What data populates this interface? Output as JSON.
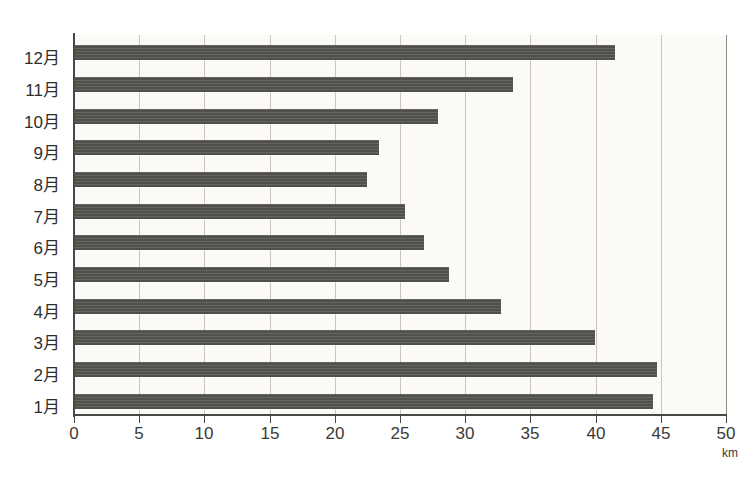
{
  "chart_data": {
    "type": "bar",
    "orientation": "horizontal",
    "title": "",
    "subtitle": "",
    "xlabel": "km",
    "ylabel": "",
    "unit": "km",
    "xlim": [
      0,
      50
    ],
    "xticks": [
      0,
      5,
      10,
      15,
      20,
      25,
      30,
      35,
      40,
      45,
      50
    ],
    "xtick_labels": [
      "0",
      "5",
      "10",
      "15",
      "20",
      "25",
      "30",
      "35",
      "40",
      "45",
      "50"
    ],
    "grid": "vertical",
    "legend": "none",
    "bar_color": "#55534e",
    "background_color": "#fbfaf6",
    "gridline_color": "#c9c7bd",
    "axis_color": "#4a4843",
    "categories": [
      "1月",
      "2月",
      "3月",
      "4月",
      "5月",
      "6月",
      "7月",
      "8月",
      "9月",
      "10月",
      "11月",
      "12月"
    ],
    "values": [
      44.3,
      44.6,
      39.9,
      32.7,
      28.7,
      26.8,
      25.3,
      22.4,
      23.3,
      27.8,
      33.6,
      41.4
    ],
    "category_order_top_to_bottom": [
      "12月",
      "11月",
      "10月",
      "9月",
      "8月",
      "7月",
      "6月",
      "5月",
      "4月",
      "3月",
      "2月",
      "1月"
    ],
    "bars": [
      {
        "label": "12月",
        "value": 41.4
      },
      {
        "label": "11月",
        "value": 33.6
      },
      {
        "label": "10月",
        "value": 27.8
      },
      {
        "label": "9月",
        "value": 23.3
      },
      {
        "label": "8月",
        "value": 22.4
      },
      {
        "label": "7月",
        "value": 25.3
      },
      {
        "label": "6月",
        "value": 26.8
      },
      {
        "label": "5月",
        "value": 28.7
      },
      {
        "label": "4月",
        "value": 32.7
      },
      {
        "label": "3月",
        "value": 39.9
      },
      {
        "label": "2月",
        "value": 44.6
      },
      {
        "label": "1月",
        "value": 44.3
      }
    ]
  }
}
